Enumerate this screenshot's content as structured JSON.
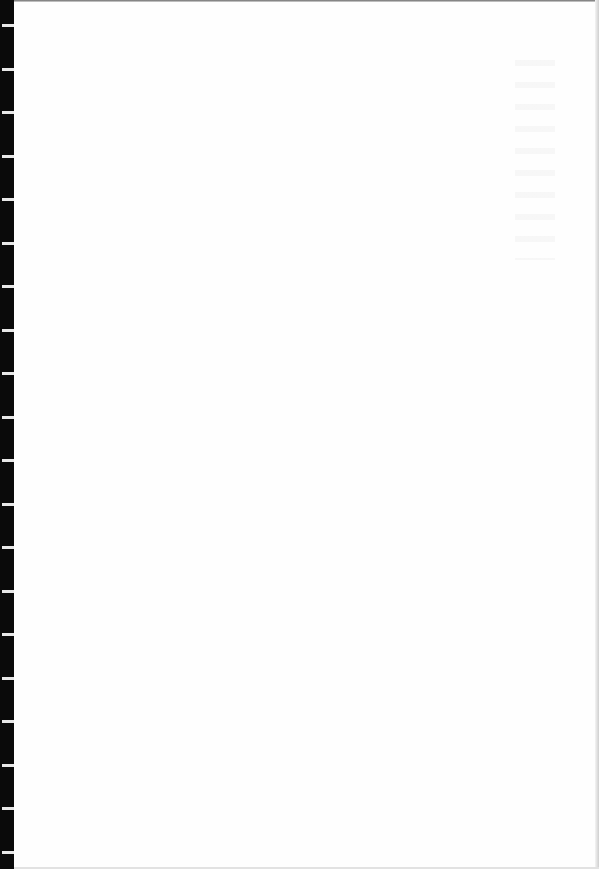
{
  "page": {
    "type": "blank scanned page",
    "text": "",
    "binding_ticks": 20
  },
  "colors": {
    "background": "#fefefe",
    "binding": "#0a0a0a",
    "tick": "#e8e8e8"
  }
}
